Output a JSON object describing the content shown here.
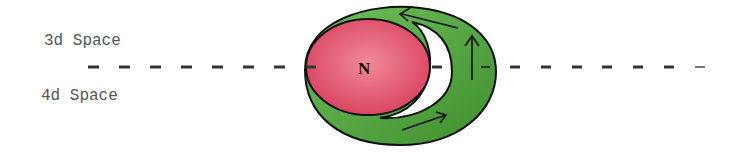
{
  "labels": {
    "upper": "3d Space",
    "lower": "4d Space",
    "center": "N"
  },
  "colors": {
    "red_disc": "#e0506a",
    "green_ring": "#4e9e3c",
    "outline": "#111111",
    "dash": "#333333",
    "text": "#555555"
  }
}
